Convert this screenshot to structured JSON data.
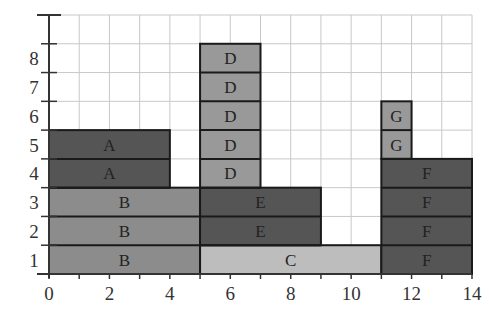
{
  "title_fragment": "...y ..., p.g...",
  "chart_data": {
    "type": "bar",
    "subtype": "stacked-block-schedule",
    "title": "",
    "xlabel": "",
    "ylabel": "",
    "xlim": [
      0,
      14
    ],
    "ylim": [
      0,
      9
    ],
    "grid": true,
    "x_ticks": [
      0,
      2,
      4,
      6,
      8,
      10,
      12,
      14
    ],
    "x_minor_ticks": [
      1,
      3,
      5,
      7,
      9,
      11,
      13
    ],
    "y_ticks": [
      1,
      2,
      3,
      4,
      5,
      6,
      7,
      8
    ],
    "blocks": [
      {
        "label": "B",
        "x0": 0,
        "x1": 5,
        "y0": 0,
        "y1": 3,
        "color": "#8c8c8c"
      },
      {
        "label": "A",
        "x0": 0,
        "x1": 4,
        "y0": 3,
        "y1": 5,
        "color": "#555555"
      },
      {
        "label": "C",
        "x0": 5,
        "x1": 11,
        "y0": 0,
        "y1": 1,
        "color": "#bdbdbd"
      },
      {
        "label": "E",
        "x0": 5,
        "x1": 9,
        "y0": 1,
        "y1": 3,
        "color": "#555555"
      },
      {
        "label": "D",
        "x0": 5,
        "x1": 7,
        "y0": 3,
        "y1": 8,
        "color": "#999999"
      },
      {
        "label": "F",
        "x0": 11,
        "x1": 14,
        "y0": 0,
        "y1": 4,
        "color": "#555555"
      },
      {
        "label": "G",
        "x0": 11,
        "x1": 12,
        "y0": 4,
        "y1": 6,
        "color": "#999999"
      }
    ],
    "legend": null
  },
  "style": {
    "grid_color": "#c8c8c8",
    "axis_color": "#333333",
    "block_border": "#1a1a1a"
  }
}
